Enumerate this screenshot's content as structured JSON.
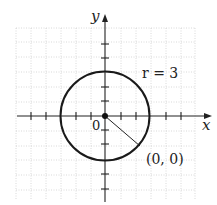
{
  "diagram": {
    "type": "circle-on-coordinate-plane",
    "axes": {
      "x_label": "x",
      "y_label": "y",
      "origin_label": "0"
    },
    "circle": {
      "center": [
        0,
        0
      ],
      "radius": 3
    },
    "annotations": {
      "radius_label": "r = 3",
      "center_label": "(0, 0)"
    },
    "grid": {
      "range_x": [
        -6,
        6
      ],
      "range_y": [
        -6,
        6
      ],
      "style": "dotted"
    },
    "ticks": {
      "x": [
        -5,
        -4,
        -2,
        -1,
        1,
        2,
        4,
        5
      ],
      "y": [
        -5,
        -4,
        -2,
        -1,
        1,
        2,
        4,
        5
      ]
    }
  }
}
